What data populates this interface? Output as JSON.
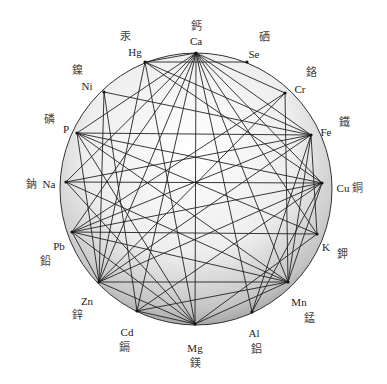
{
  "diagram": {
    "center": [
      196,
      189
    ],
    "radius": 136,
    "nodes": [
      {
        "id": "Ca",
        "label": "Ca",
        "cjk": "鈣",
        "x": 196,
        "y": 53,
        "lx": 196,
        "ly": 42,
        "cx": 196,
        "cy": 27,
        "anchor": "middle"
      },
      {
        "id": "Se",
        "label": "Se",
        "cjk": "硒",
        "x": 247,
        "y": 62,
        "lx": 254,
        "ly": 55,
        "cx": 264,
        "cy": 38,
        "anchor": "middle"
      },
      {
        "id": "Cr",
        "label": "Cr",
        "cjk": "鉻",
        "x": 285,
        "y": 93,
        "lx": 300,
        "ly": 90,
        "cx": 311,
        "cy": 73,
        "anchor": "middle"
      },
      {
        "id": "Fe",
        "label": "Fe",
        "cjk": "鐵",
        "x": 311,
        "y": 135,
        "lx": 326,
        "ly": 133,
        "cx": 344,
        "cy": 123,
        "anchor": "middle"
      },
      {
        "id": "Cu",
        "label": "Cu",
        "cjk": "銅",
        "x": 322,
        "y": 183,
        "lx": 343,
        "ly": 189,
        "cx": 357,
        "cy": 189,
        "anchor": "middle"
      },
      {
        "id": "K",
        "label": "K",
        "cjk": "鉀",
        "x": 317,
        "y": 234,
        "lx": 326,
        "ly": 248,
        "cx": 342,
        "cy": 255,
        "anchor": "middle"
      },
      {
        "id": "Mn",
        "label": "Mn",
        "cjk": "錳",
        "x": 288,
        "y": 282,
        "lx": 299,
        "ly": 303,
        "cx": 309,
        "cy": 319,
        "anchor": "middle"
      },
      {
        "id": "Al",
        "label": "Al",
        "cjk": "鋁",
        "x": 252,
        "y": 312,
        "lx": 254,
        "ly": 334,
        "cx": 256,
        "cy": 350,
        "anchor": "middle"
      },
      {
        "id": "Mg",
        "label": "Mg",
        "cjk": "鎂",
        "x": 195,
        "y": 324,
        "lx": 195,
        "ly": 349,
        "cx": 195,
        "cy": 364,
        "anchor": "middle"
      },
      {
        "id": "Cd",
        "label": "Cd",
        "cjk": "鎘",
        "x": 137,
        "y": 311,
        "lx": 127,
        "ly": 333,
        "cx": 124,
        "cy": 348,
        "anchor": "middle"
      },
      {
        "id": "Zn",
        "label": "Zn",
        "cjk": "鋅",
        "x": 99,
        "y": 282,
        "lx": 87,
        "ly": 302,
        "cx": 77,
        "cy": 316,
        "anchor": "middle"
      },
      {
        "id": "Pb",
        "label": "Pb",
        "cjk": "鉛",
        "x": 72,
        "y": 232,
        "lx": 59,
        "ly": 247,
        "cx": 45,
        "cy": 262,
        "anchor": "middle"
      },
      {
        "id": "Na",
        "label": "Na",
        "cjk": "鈉",
        "x": 66,
        "y": 182,
        "lx": 49,
        "ly": 185,
        "cx": 31,
        "cy": 185,
        "anchor": "middle"
      },
      {
        "id": "P",
        "label": "P",
        "cjk": "磷",
        "x": 77,
        "y": 133,
        "lx": 66,
        "ly": 130,
        "cx": 49,
        "cy": 120,
        "anchor": "middle"
      },
      {
        "id": "Ni",
        "label": "Ni",
        "cjk": "鎳",
        "x": 104,
        "y": 92,
        "lx": 87,
        "ly": 87,
        "cx": 77,
        "cy": 71,
        "anchor": "middle"
      },
      {
        "id": "Hg",
        "label": "Hg",
        "cjk": "汞",
        "x": 145,
        "y": 62,
        "lx": 135,
        "ly": 53,
        "cx": 125,
        "cy": 37,
        "anchor": "middle"
      }
    ],
    "edges": [
      [
        "Ca",
        "Hg"
      ],
      [
        "Ca",
        "Fe"
      ],
      [
        "Ca",
        "Cu"
      ],
      [
        "Ca",
        "K"
      ],
      [
        "Ca",
        "Mn"
      ],
      [
        "Ca",
        "Al"
      ],
      [
        "Ca",
        "Mg"
      ],
      [
        "Ca",
        "Cd"
      ],
      [
        "Ca",
        "Zn"
      ],
      [
        "Ca",
        "Pb"
      ],
      [
        "Ca",
        "Na"
      ],
      [
        "Ca",
        "P"
      ],
      [
        "Ca",
        "Cr"
      ],
      [
        "Hg",
        "Se"
      ],
      [
        "Hg",
        "Cu"
      ],
      [
        "Hg",
        "Fe"
      ],
      [
        "Hg",
        "Mg"
      ],
      [
        "Hg",
        "Zn"
      ],
      [
        "Ni",
        "Zn"
      ],
      [
        "Ni",
        "Cd"
      ],
      [
        "Ni",
        "Fe"
      ],
      [
        "P",
        "Fe"
      ],
      [
        "P",
        "Cu"
      ],
      [
        "P",
        "K"
      ],
      [
        "P",
        "Mn"
      ],
      [
        "P",
        "Mg"
      ],
      [
        "P",
        "Zn"
      ],
      [
        "Na",
        "Cu"
      ],
      [
        "Na",
        "Mn"
      ],
      [
        "Na",
        "Mg"
      ],
      [
        "Na",
        "Fe"
      ],
      [
        "Cr",
        "Mn"
      ],
      [
        "Cr",
        "Pb"
      ],
      [
        "Cr",
        "Zn"
      ],
      [
        "Fe",
        "Pb"
      ],
      [
        "Fe",
        "Mn"
      ],
      [
        "Fe",
        "K"
      ],
      [
        "Fe",
        "Zn"
      ],
      [
        "Fe",
        "Al"
      ],
      [
        "Cu",
        "Pb"
      ],
      [
        "Cu",
        "Mn"
      ],
      [
        "Cu",
        "Zn"
      ],
      [
        "Cu",
        "Cd"
      ],
      [
        "Cu",
        "Al"
      ],
      [
        "K",
        "Pb"
      ],
      [
        "K",
        "Mg"
      ],
      [
        "Mn",
        "Pb"
      ],
      [
        "Mn",
        "Cd"
      ],
      [
        "Mn",
        "Mg"
      ],
      [
        "Mn",
        "Zn"
      ],
      [
        "Pb",
        "Mg"
      ],
      [
        "Pb",
        "Zn"
      ],
      [
        "Cd",
        "Mg"
      ],
      [
        "Zn",
        "Mg"
      ]
    ],
    "fill_light": "#ffffff",
    "fill_dark": "#9a9a9a",
    "stroke": "#222222"
  }
}
